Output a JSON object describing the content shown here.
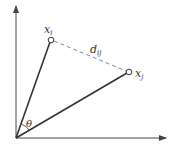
{
  "diagram": {
    "type": "vector-angle-distance",
    "labels": {
      "point_i": "x",
      "point_i_sub": "i",
      "point_j": "x",
      "point_j_sub": "j",
      "distance": "d",
      "distance_sub": "ij",
      "angle": "θ"
    },
    "colors": {
      "line": "#333333",
      "dashed": "#888888",
      "axis": "#444444"
    }
  }
}
